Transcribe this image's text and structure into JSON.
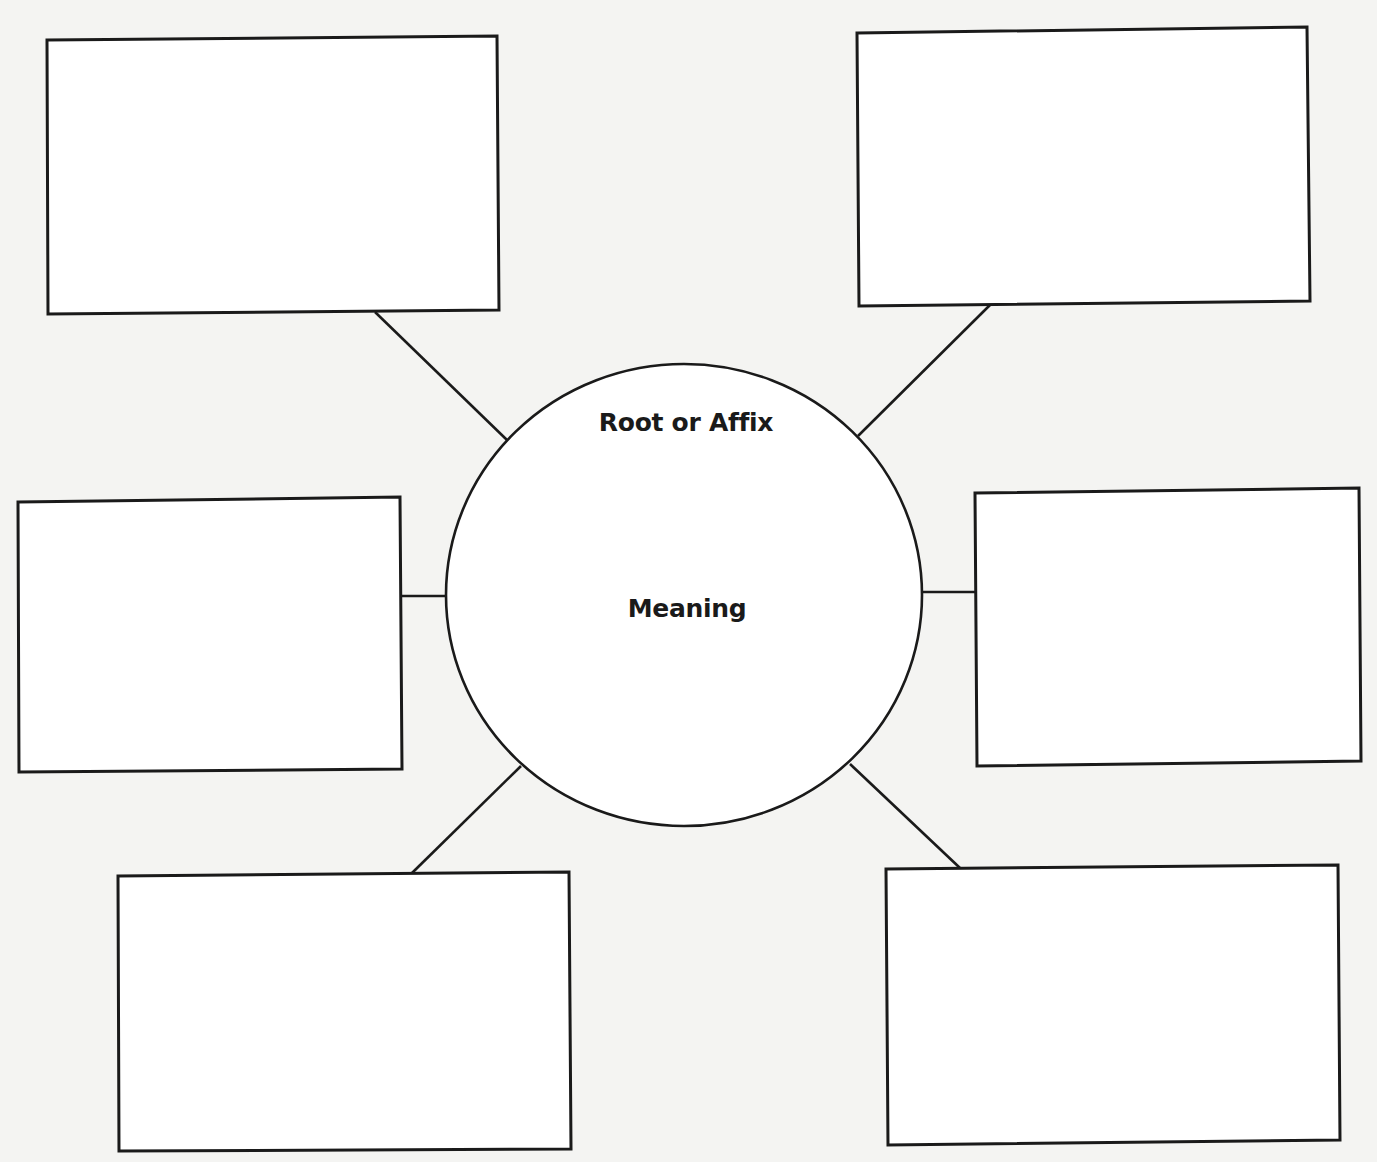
{
  "diagram": {
    "type": "word-web graphic organizer",
    "stroke_color": "#1a1a1a",
    "background_color": "#f4f4f2",
    "box_fill": "#ffffff",
    "center": {
      "shape": "circle",
      "cx": 684,
      "cy": 595,
      "rx": 238,
      "ry": 231,
      "title": "Root or Affix",
      "subtitle": "Meaning",
      "title_pos": {
        "x": 686,
        "y": 408
      },
      "subtitle_pos": {
        "x": 687,
        "y": 594
      }
    },
    "boxes": [
      {
        "name": "top-left",
        "points": "47,40 497,36 499,310 48,314",
        "text": ""
      },
      {
        "name": "top-right",
        "points": "857,33 1307,27 1310,301 859,306",
        "text": ""
      },
      {
        "name": "middle-left",
        "points": "18,502 400,497 402,769 19,772",
        "text": ""
      },
      {
        "name": "middle-right",
        "points": "975,493 1359,488 1361,761 977,766",
        "text": ""
      },
      {
        "name": "bottom-left",
        "points": "118,876 569,872 571,1149 119,1151",
        "text": ""
      },
      {
        "name": "bottom-right",
        "points": "886,869 1338,865 1340,1140 888,1145",
        "text": ""
      }
    ],
    "connectors": [
      {
        "name": "connector-top-left",
        "x1": 375,
        "y1": 312,
        "x2": 507,
        "y2": 440
      },
      {
        "name": "connector-top-right",
        "x1": 990,
        "y1": 305,
        "x2": 858,
        "y2": 436
      },
      {
        "name": "connector-middle-left",
        "x1": 401,
        "y1": 596,
        "x2": 445,
        "y2": 596
      },
      {
        "name": "connector-middle-right",
        "x1": 922,
        "y1": 592,
        "x2": 976,
        "y2": 592
      },
      {
        "name": "connector-bottom-left",
        "x1": 521,
        "y1": 766,
        "x2": 412,
        "y2": 873
      },
      {
        "name": "connector-bottom-right",
        "x1": 850,
        "y1": 764,
        "x2": 960,
        "y2": 868
      }
    ]
  }
}
